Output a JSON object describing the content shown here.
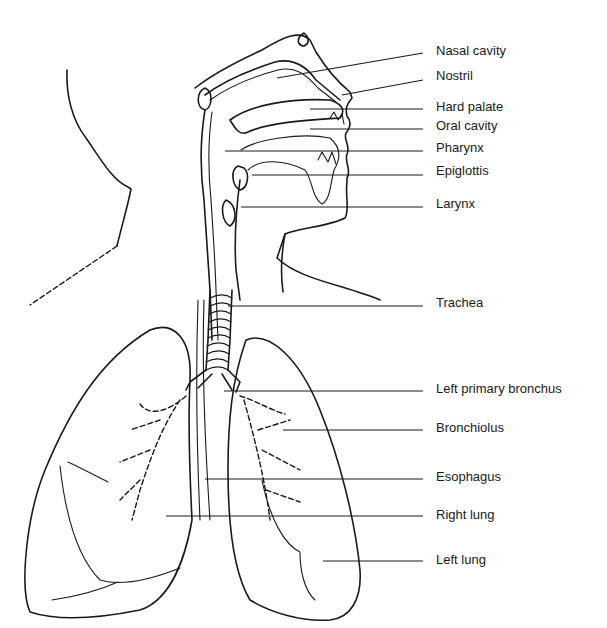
{
  "diagram": {
    "colors": {
      "ink": "#1a1a1a",
      "background": "#ffffff"
    },
    "labels": [
      {
        "id": "nasal-cavity",
        "text": "Nasal cavity",
        "x": 436,
        "y": 51,
        "line": [
          277,
          78,
          423,
          53
        ]
      },
      {
        "id": "nostril",
        "text": "Nostril",
        "x": 436,
        "y": 76,
        "line": [
          342,
          95,
          423,
          80
        ]
      },
      {
        "id": "hard-palate",
        "text": "Hard palate",
        "x": 436,
        "y": 106,
        "line": [
          310,
          109,
          423,
          109
        ]
      },
      {
        "id": "oral-cavity",
        "text": "Oral cavity",
        "x": 436,
        "y": 125,
        "line": [
          310,
          129,
          423,
          129
        ]
      },
      {
        "id": "pharynx",
        "text": "Pharynx",
        "x": 436,
        "y": 147,
        "line": [
          225,
          151,
          423,
          151
        ]
      },
      {
        "id": "epiglottis",
        "text": "Epiglottis",
        "x": 436,
        "y": 170,
        "line": [
          252,
          175,
          423,
          175
        ]
      },
      {
        "id": "larynx",
        "text": "Larynx",
        "x": 436,
        "y": 202,
        "line": [
          241,
          207,
          423,
          207
        ]
      },
      {
        "id": "trachea",
        "text": "Trachea",
        "x": 436,
        "y": 301,
        "line": [
          228,
          306,
          423,
          306
        ]
      },
      {
        "id": "left-primary-bronchus",
        "text": "Left primary bronchus",
        "x": 436,
        "y": 388,
        "line": [
          224,
          391,
          423,
          391
        ]
      },
      {
        "id": "bronchiolus",
        "text": "Bronchiolus",
        "x": 436,
        "y": 427,
        "line": [
          283,
          430,
          423,
          430
        ]
      },
      {
        "id": "esophagus",
        "text": "Esophagus",
        "x": 436,
        "y": 475,
        "line": [
          205,
          479,
          423,
          479
        ]
      },
      {
        "id": "right-lung",
        "text": "Right lung",
        "x": 436,
        "y": 514,
        "line": [
          166,
          516,
          423,
          516
        ]
      },
      {
        "id": "left-lung",
        "text": "Left lung",
        "x": 436,
        "y": 558,
        "line": [
          323,
          561,
          423,
          561
        ]
      }
    ]
  }
}
